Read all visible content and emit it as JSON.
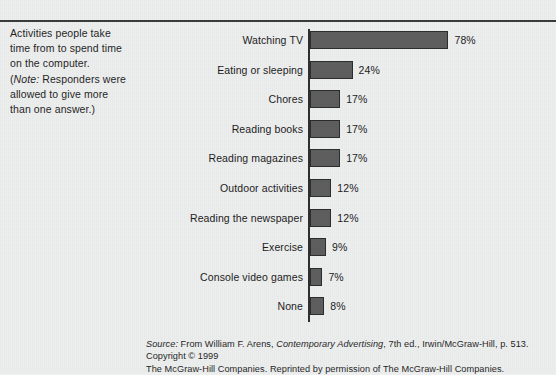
{
  "caption": {
    "line1": "Activities people take",
    "line2": "time from to spend time",
    "line3": "on the computer.",
    "note_open": "(",
    "note_word": "Note:",
    "note_rest": " Responders were",
    "line5": "allowed to give more",
    "line6": "than one answer.)"
  },
  "source": {
    "label": "Source:",
    "part1": " From William F. Arens, ",
    "title": "Contemporary Advertising",
    "part2": ", 7th ed., Irwin/McGraw-Hill, p. 513. Copyright © 1999",
    "line2": "The McGraw-Hill Companies. Reprinted by permission of The McGraw-Hill Companies."
  },
  "colors": {
    "bar_fill": "#5d5d5d",
    "bar_stroke": "#2b2b2b",
    "background": "#edeeee",
    "rule": "#3a3a3a"
  },
  "chart_data": {
    "type": "bar",
    "orientation": "horizontal",
    "title": "",
    "xlabel": "",
    "ylabel": "",
    "xlim": [
      0,
      80
    ],
    "grid": false,
    "legend": false,
    "categories": [
      "Watching TV",
      "Eating or sleeping",
      "Chores",
      "Reading books",
      "Reading magazines",
      "Outdoor activities",
      "Reading the newspaper",
      "Exercise",
      "Console video games",
      "None"
    ],
    "values": [
      78,
      24,
      17,
      17,
      17,
      12,
      12,
      9,
      7,
      8
    ],
    "value_labels": [
      "78%",
      "24%",
      "17%",
      "17%",
      "17%",
      "12%",
      "12%",
      "9%",
      "7%",
      "8%"
    ]
  }
}
